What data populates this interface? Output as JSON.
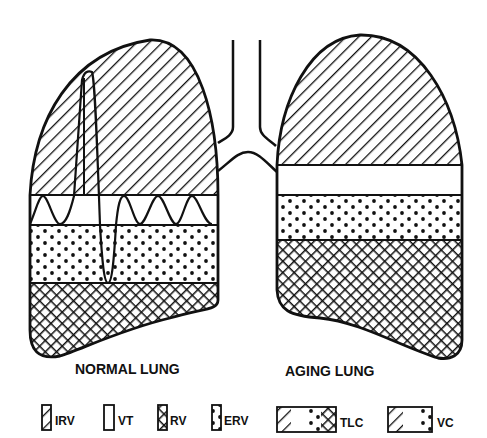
{
  "figure": {
    "type": "lung volume comparison diagram",
    "ink_color": "#111111",
    "background_color": "#ffffff"
  },
  "lungs": [
    {
      "id": "normal",
      "label": "NORMAL LUNG",
      "bands_top_to_bottom": [
        "IRV",
        "VT",
        "ERV",
        "RV"
      ],
      "has_spirogram_trace": true
    },
    {
      "id": "aging",
      "label": "AGING LUNG",
      "bands_top_to_bottom": [
        "IRV",
        "VT",
        "ERV",
        "RV"
      ],
      "has_spirogram_trace": false
    }
  ],
  "legend": [
    {
      "code": "IRV",
      "pattern": "diagonal-hatch"
    },
    {
      "code": "VT",
      "pattern": "blank"
    },
    {
      "code": "RV",
      "pattern": "cross-hatch"
    },
    {
      "code": "ERV",
      "pattern": "dots"
    },
    {
      "code": "TLC",
      "pattern": "diagonal-hatch + blank + dots + cross-hatch"
    },
    {
      "code": "VC",
      "pattern": "diagonal-hatch + blank + dots"
    }
  ]
}
